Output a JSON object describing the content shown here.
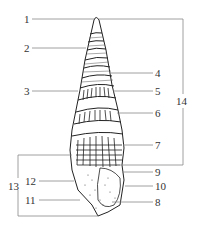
{
  "figure": {
    "colors": {
      "line": "#888888",
      "ink": "#222222",
      "label": "#333333"
    }
  },
  "labels": [
    {
      "id": "1",
      "text": "1",
      "x": 24,
      "y": 14
    },
    {
      "id": "2",
      "text": "2",
      "x": 24,
      "y": 43
    },
    {
      "id": "3",
      "text": "3",
      "x": 24,
      "y": 86
    },
    {
      "id": "4",
      "text": "4",
      "x": 155,
      "y": 68
    },
    {
      "id": "5",
      "text": "5",
      "x": 155,
      "y": 86
    },
    {
      "id": "6",
      "text": "6",
      "x": 155,
      "y": 108
    },
    {
      "id": "7",
      "text": "7",
      "x": 155,
      "y": 140
    },
    {
      "id": "14",
      "text": "14",
      "x": 176,
      "y": 96
    },
    {
      "id": "9",
      "text": "9",
      "x": 155,
      "y": 167
    },
    {
      "id": "10",
      "text": "10",
      "x": 155,
      "y": 181
    },
    {
      "id": "8",
      "text": "8",
      "x": 155,
      "y": 197
    },
    {
      "id": "13",
      "text": "13",
      "x": 8,
      "y": 181
    },
    {
      "id": "12",
      "text": "12",
      "x": 25,
      "y": 176
    },
    {
      "id": "11",
      "text": "11",
      "x": 25,
      "y": 195
    }
  ]
}
